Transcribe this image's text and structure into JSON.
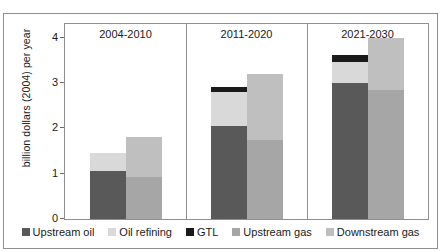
{
  "figure": {
    "ylabel": "billion dollars (2004) per year",
    "clipped_caption_above": "",
    "frame_color": "#8f8f8f",
    "background": "#ffffff"
  },
  "legend": {
    "items": [
      {
        "label": "Upstream oil",
        "color": "#595959"
      },
      {
        "label": "Oil refining",
        "color": "#d9d9d9"
      },
      {
        "label": "GTL",
        "color": "#1a1a1a"
      },
      {
        "label": "Upstream gas",
        "color": "#a6a6a6"
      },
      {
        "label": "Downstream gas",
        "color": "#bfbfbf"
      }
    ]
  },
  "chart_data": {
    "type": "bar",
    "title": "",
    "xlabel": "",
    "ylabel": "billion dollars (2004) per year",
    "ylim": [
      0,
      4.3
    ],
    "yticks": [
      0,
      1,
      2,
      3,
      4
    ],
    "ytick_labels": [
      "0",
      "1",
      "2",
      "3",
      "4"
    ],
    "grid": false,
    "legend_position": "bottom",
    "stacked": true,
    "panels": [
      {
        "label": "2004-2010",
        "bars": [
          {
            "name": "oil",
            "segments": [
              {
                "name": "Upstream oil",
                "value": 1.05,
                "color": "#595959"
              },
              {
                "name": "Oil refining",
                "value": 0.4,
                "color": "#d9d9d9"
              },
              {
                "name": "GTL",
                "value": 0.0,
                "color": "#1a1a1a"
              }
            ],
            "total": 1.45
          },
          {
            "name": "gas",
            "segments": [
              {
                "name": "Upstream gas",
                "value": 0.92,
                "color": "#a6a6a6"
              },
              {
                "name": "Downstream gas",
                "value": 0.88,
                "color": "#bfbfbf"
              }
            ],
            "total": 1.8
          }
        ]
      },
      {
        "label": "2011-2020",
        "bars": [
          {
            "name": "oil",
            "segments": [
              {
                "name": "Upstream oil",
                "value": 2.05,
                "color": "#595959"
              },
              {
                "name": "Oil refining",
                "value": 0.75,
                "color": "#d9d9d9"
              },
              {
                "name": "GTL",
                "value": 0.12,
                "color": "#1a1a1a"
              }
            ],
            "total": 2.92
          },
          {
            "name": "gas",
            "segments": [
              {
                "name": "Upstream gas",
                "value": 1.75,
                "color": "#a6a6a6"
              },
              {
                "name": "Downstream gas",
                "value": 1.45,
                "color": "#bfbfbf"
              }
            ],
            "total": 3.2
          }
        ]
      },
      {
        "label": "2021-2030",
        "bars": [
          {
            "name": "oil",
            "segments": [
              {
                "name": "Upstream oil",
                "value": 3.0,
                "color": "#595959"
              },
              {
                "name": "Oil refining",
                "value": 0.47,
                "color": "#d9d9d9"
              },
              {
                "name": "GTL",
                "value": 0.14,
                "color": "#1a1a1a"
              }
            ],
            "total": 3.61
          },
          {
            "name": "gas",
            "segments": [
              {
                "name": "Upstream gas",
                "value": 2.85,
                "color": "#a6a6a6"
              },
              {
                "name": "Downstream gas",
                "value": 1.15,
                "color": "#bfbfbf"
              }
            ],
            "total": 4.0
          }
        ]
      }
    ]
  }
}
